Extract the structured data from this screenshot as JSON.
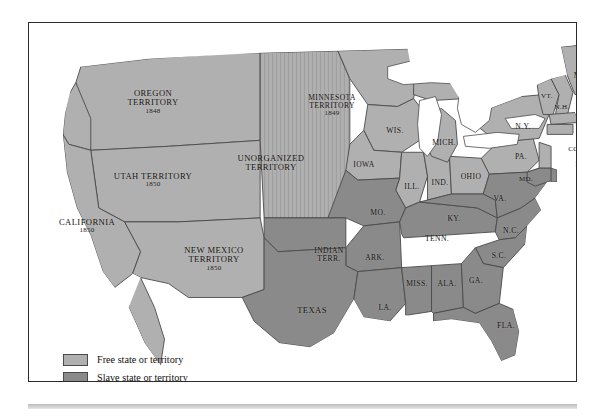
{
  "map": {
    "title": "United States 1850 — Free and Slave States and Territories",
    "colors": {
      "free": "#b0b0b0",
      "slave": "#8a8a8a",
      "open": "#b0b0b0",
      "water": "#ffffff",
      "border": "#4a4a4a",
      "frame": "#2b2b2b",
      "text": "#14110f"
    },
    "labels": [
      {
        "id": "oregon-territory",
        "name": "OREGON\nTERRITORY",
        "year": "1848",
        "x": 124,
        "y": 79,
        "size": "s9",
        "fill": "free"
      },
      {
        "id": "utah-territory",
        "name": "UTAH TERRITORY",
        "year": "1850",
        "x": 124,
        "y": 157,
        "size": "s9",
        "fill": "free"
      },
      {
        "id": "california",
        "name": "CALIFORNIA",
        "year": "1850",
        "x": 58,
        "y": 203,
        "size": "s9",
        "fill": "free"
      },
      {
        "id": "new-mexico-territory",
        "name": "NEW MEXICO\nTERRITORY",
        "year": "1850",
        "x": 185,
        "y": 236,
        "size": "s9",
        "fill": "free"
      },
      {
        "id": "unorganized-territory",
        "name": "UNORGANIZED\nTERRITORY",
        "year": "",
        "x": 242,
        "y": 140,
        "size": "s9",
        "fill": "open"
      },
      {
        "id": "minnesota-territory",
        "name": "MINNESOTA\nTERRITORY",
        "year": "1849",
        "x": 303,
        "y": 83,
        "size": "s8",
        "fill": "free"
      },
      {
        "id": "wisconsin",
        "name": "WIS.",
        "year": "",
        "x": 366,
        "y": 108,
        "size": "s8",
        "fill": "free"
      },
      {
        "id": "iowa",
        "name": "IOWA",
        "year": "",
        "x": 335,
        "y": 142,
        "size": "s8",
        "fill": "free"
      },
      {
        "id": "illinois",
        "name": "ILL.",
        "year": "",
        "x": 383,
        "y": 164,
        "size": "s8",
        "fill": "free"
      },
      {
        "id": "indiana",
        "name": "IND.",
        "year": "",
        "x": 411,
        "y": 160,
        "size": "s8",
        "fill": "free"
      },
      {
        "id": "ohio",
        "name": "OHIO",
        "year": "",
        "x": 442,
        "y": 154,
        "size": "s8",
        "fill": "free"
      },
      {
        "id": "michigan",
        "name": "MICH.",
        "year": "",
        "x": 415,
        "y": 120,
        "size": "s8",
        "fill": "free"
      },
      {
        "id": "missouri",
        "name": "MO.",
        "year": "",
        "x": 349,
        "y": 190,
        "size": "s8",
        "fill": "slave"
      },
      {
        "id": "indian-territory",
        "name": "INDIAN\nTERR.",
        "year": "",
        "x": 300,
        "y": 232,
        "size": "s8",
        "fill": "slave"
      },
      {
        "id": "arkansas",
        "name": "ARK.",
        "year": "",
        "x": 346,
        "y": 235,
        "size": "s8",
        "fill": "slave"
      },
      {
        "id": "texas",
        "name": "TEXAS",
        "year": "",
        "x": 283,
        "y": 288,
        "size": "s9",
        "fill": "slave"
      },
      {
        "id": "louisiana",
        "name": "LA.",
        "year": "",
        "x": 356,
        "y": 285,
        "size": "s8",
        "fill": "slave"
      },
      {
        "id": "mississippi",
        "name": "MISS.",
        "year": "",
        "x": 388,
        "y": 261,
        "size": "s8",
        "fill": "slave"
      },
      {
        "id": "alabama",
        "name": "ALA.",
        "year": "",
        "x": 418,
        "y": 261,
        "size": "s8",
        "fill": "slave"
      },
      {
        "id": "tennessee",
        "name": "TENN.",
        "year": "",
        "x": 408,
        "y": 216,
        "size": "s8",
        "fill": "slave"
      },
      {
        "id": "kentucky",
        "name": "KY.",
        "year": "",
        "x": 425,
        "y": 196,
        "size": "s8",
        "fill": "slave"
      },
      {
        "id": "georgia",
        "name": "GA.",
        "year": "",
        "x": 447,
        "y": 258,
        "size": "s8",
        "fill": "slave"
      },
      {
        "id": "florida",
        "name": "FLA.",
        "year": "",
        "x": 477,
        "y": 303,
        "size": "s8",
        "fill": "slave"
      },
      {
        "id": "south-carolina",
        "name": "S.C.",
        "year": "",
        "x": 470,
        "y": 233,
        "size": "s8",
        "fill": "slave"
      },
      {
        "id": "north-carolina",
        "name": "N.C.",
        "year": "",
        "x": 482,
        "y": 208,
        "size": "s8",
        "fill": "slave"
      },
      {
        "id": "virginia",
        "name": "VA.",
        "year": "",
        "x": 471,
        "y": 176,
        "size": "s8",
        "fill": "slave"
      },
      {
        "id": "maryland",
        "name": "MD.",
        "year": "",
        "x": 497,
        "y": 157,
        "size": "s7",
        "fill": "slave"
      },
      {
        "id": "delaware",
        "name": "DEL.",
        "year": "",
        "x": 557,
        "y": 156,
        "size": "s7",
        "fill": "slave"
      },
      {
        "id": "pennsylvania",
        "name": "PA.",
        "year": "",
        "x": 492,
        "y": 134,
        "size": "s8",
        "fill": "free"
      },
      {
        "id": "new-jersey",
        "name": "N.J.",
        "year": "",
        "x": 553,
        "y": 142,
        "size": "s7",
        "fill": "free"
      },
      {
        "id": "new-york",
        "name": "N.Y.",
        "year": "",
        "x": 494,
        "y": 104,
        "size": "s8",
        "fill": "free"
      },
      {
        "id": "connecticut",
        "name": "CONN.",
        "year": "",
        "x": 551,
        "y": 127,
        "size": "s7",
        "fill": "free"
      },
      {
        "id": "rhode-island",
        "name": "R.I.",
        "year": "",
        "x": 556,
        "y": 116,
        "size": "s7",
        "fill": "free"
      },
      {
        "id": "massachusetts",
        "name": "MASS.",
        "year": "",
        "x": 558,
        "y": 102,
        "size": "s7",
        "fill": "free"
      },
      {
        "id": "vermont",
        "name": "VT.",
        "year": "",
        "x": 518,
        "y": 74,
        "size": "s7",
        "fill": "free"
      },
      {
        "id": "new-hampshire",
        "name": "N.H.",
        "year": "",
        "x": 533,
        "y": 85,
        "size": "s7",
        "fill": "free"
      },
      {
        "id": "maine",
        "name": "ME.",
        "year": "",
        "x": 552,
        "y": 53,
        "size": "s8",
        "fill": "free"
      }
    ]
  },
  "legend": {
    "items": [
      {
        "id": "legend-free",
        "swatch": "free",
        "label": "Free state or territory"
      },
      {
        "id": "legend-slave",
        "swatch": "slave",
        "label": "Slave state or territory"
      },
      {
        "id": "legend-open",
        "swatch": "open",
        "label": "Territory open to slavery"
      }
    ]
  }
}
